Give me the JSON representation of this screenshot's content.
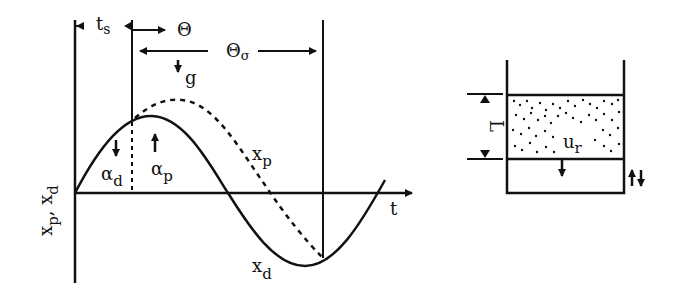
{
  "left_diagram": {
    "y_axis_label": "x",
    "y_axis_label_sub1": "p",
    "y_axis_label_sep": ", x",
    "y_axis_label_sub2": "d",
    "x_axis_label": "t",
    "ts_label": "t",
    "ts_sub": "s",
    "theta_label": "Θ",
    "theta_sigma_label": "Θ",
    "theta_sigma_sub": "σ",
    "g_label": "g",
    "alpha_d": "α",
    "alpha_d_sub": "d",
    "alpha_p": "α",
    "alpha_p_sub": "p",
    "xp_curve_label": "x",
    "xp_curve_sub": "p",
    "xd_curve_label": "x",
    "xd_curve_sub": "d",
    "curves": [
      {
        "name": "x_d",
        "style": "solid",
        "description": "driving displacement (sinusoid)"
      },
      {
        "name": "x_p",
        "style": "dashed",
        "description": "particle/bed displacement, lagging"
      }
    ]
  },
  "right_diagram": {
    "bed_height_label": "L",
    "velocity_label": "u",
    "velocity_sub": "r",
    "oscillation_symbol": "⇅"
  },
  "colors": {
    "ink": "#111111",
    "background": "#ffffff"
  }
}
